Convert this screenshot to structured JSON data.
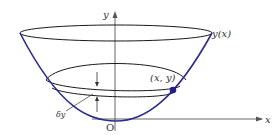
{
  "diagram": {
    "type": "paraboloid-cross-section",
    "labels": {
      "y_axis": "y",
      "x_axis": "x",
      "curve": "y(x)",
      "point": "(x, y)",
      "thickness": "δy",
      "origin": "O"
    },
    "colors": {
      "curve": "#2b2a8f",
      "ellipse": "#1a1a1a",
      "axis": "#555555",
      "point": "#1f1c8c",
      "text": "#333333"
    }
  }
}
